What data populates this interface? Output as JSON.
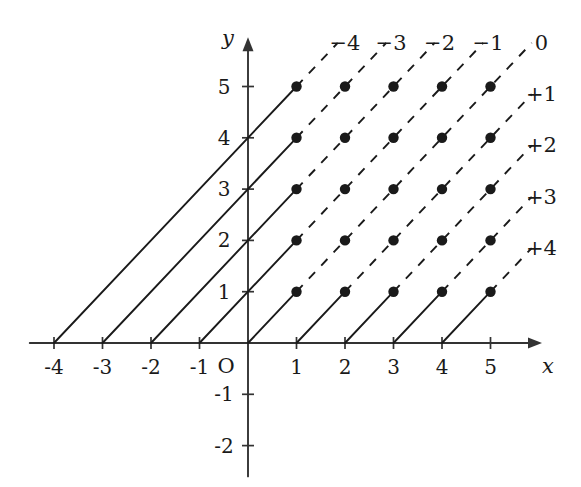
{
  "figure": {
    "axes": {
      "x_name": "x",
      "y_name": "y",
      "origin_label": "O",
      "x_ticks": [
        {
          "value": -4,
          "label": "-4"
        },
        {
          "value": -3,
          "label": "-3"
        },
        {
          "value": -2,
          "label": "-2"
        },
        {
          "value": -1,
          "label": "-1"
        },
        {
          "value": 1,
          "label": "1"
        },
        {
          "value": 2,
          "label": "2"
        },
        {
          "value": 3,
          "label": "3"
        },
        {
          "value": 4,
          "label": "4"
        },
        {
          "value": 5,
          "label": "5"
        }
      ],
      "y_ticks": [
        {
          "value": 5,
          "label": "5"
        },
        {
          "value": 4,
          "label": "4"
        },
        {
          "value": 3,
          "label": "3"
        },
        {
          "value": 2,
          "label": "2"
        },
        {
          "value": 1,
          "label": "1"
        },
        {
          "value": -1,
          "label": "-1"
        },
        {
          "value": -2,
          "label": "-2"
        }
      ],
      "x_range": [
        -4.5,
        6.0
      ],
      "y_range": [
        -2.6,
        5.9
      ]
    },
    "line_labels": [
      {
        "id": "c-minus-4",
        "text": "−4",
        "x": 2.0,
        "y": 5.85
      },
      {
        "id": "c-minus-3",
        "text": "−3",
        "x": 2.95,
        "y": 5.85
      },
      {
        "id": "c-minus-2",
        "text": "−2",
        "x": 3.95,
        "y": 5.85
      },
      {
        "id": "c-minus-1",
        "text": "−1",
        "x": 4.95,
        "y": 5.85
      },
      {
        "id": "c-zero",
        "text": "0",
        "x": 6.05,
        "y": 5.85
      },
      {
        "id": "c-plus-1",
        "text": "+1",
        "x": 6.05,
        "y": 4.85
      },
      {
        "id": "c-plus-2",
        "text": "+2",
        "x": 6.05,
        "y": 3.85
      },
      {
        "id": "c-plus-3",
        "text": "+3",
        "x": 6.05,
        "y": 2.85
      },
      {
        "id": "c-plus-4",
        "text": "+4",
        "x": 6.05,
        "y": 1.85
      }
    ]
  },
  "chart_data": {
    "type": "scatter",
    "xlabel": "x",
    "ylabel": "y",
    "xlim": [
      -4.5,
      6.0
    ],
    "ylim": [
      -2.6,
      5.9
    ],
    "grid": false,
    "legend_position": "inline-end-of-line",
    "x_tick_values": [
      -4,
      -3,
      -2,
      -1,
      1,
      2,
      3,
      4,
      5
    ],
    "y_tick_values": [
      5,
      4,
      3,
      2,
      1,
      -1,
      -2
    ],
    "lines": [
      {
        "label": "−4",
        "c": -4,
        "equation": "y = x + 4",
        "x_intercept": -4,
        "solid_from": [
          -4,
          0
        ],
        "solid_to": [
          1,
          5
        ],
        "dashed_to": [
          1.85,
          5.85
        ],
        "points": [
          [
            1,
            5
          ]
        ]
      },
      {
        "label": "−3",
        "c": -3,
        "equation": "y = x + 3",
        "x_intercept": -3,
        "solid_from": [
          -3,
          0
        ],
        "solid_to": [
          1,
          4
        ],
        "dashed_to": [
          2.85,
          5.85
        ],
        "points": [
          [
            1,
            4
          ],
          [
            2,
            5
          ]
        ]
      },
      {
        "label": "−2",
        "c": -2,
        "equation": "y = x + 2",
        "x_intercept": -2,
        "solid_from": [
          -2,
          0
        ],
        "solid_to": [
          1,
          3
        ],
        "dashed_to": [
          3.85,
          5.85
        ],
        "points": [
          [
            1,
            3
          ],
          [
            2,
            4
          ],
          [
            3,
            5
          ]
        ]
      },
      {
        "label": "−1",
        "c": -1,
        "equation": "y = x + 1",
        "x_intercept": -1,
        "solid_from": [
          -1,
          0
        ],
        "solid_to": [
          1,
          2
        ],
        "dashed_to": [
          4.85,
          5.85
        ],
        "points": [
          [
            1,
            2
          ],
          [
            2,
            3
          ],
          [
            3,
            4
          ],
          [
            4,
            5
          ]
        ]
      },
      {
        "label": "0",
        "c": 0,
        "equation": "y = x",
        "x_intercept": 0,
        "solid_from": [
          0,
          0
        ],
        "solid_to": [
          1,
          1
        ],
        "dashed_to": [
          5.85,
          5.85
        ],
        "points": [
          [
            1,
            1
          ],
          [
            2,
            2
          ],
          [
            3,
            3
          ],
          [
            4,
            4
          ],
          [
            5,
            5
          ]
        ]
      },
      {
        "label": "+1",
        "c": 1,
        "equation": "y = x - 1",
        "x_intercept": 1,
        "solid_from": [
          1,
          0
        ],
        "solid_to": [
          2,
          1
        ],
        "dashed_to": [
          5.85,
          4.85
        ],
        "points": [
          [
            2,
            1
          ],
          [
            3,
            2
          ],
          [
            4,
            3
          ],
          [
            5,
            4
          ]
        ]
      },
      {
        "label": "+2",
        "c": 2,
        "equation": "y = x - 2",
        "x_intercept": 2,
        "solid_from": [
          2,
          0
        ],
        "solid_to": [
          3,
          1
        ],
        "dashed_to": [
          5.85,
          3.85
        ],
        "points": [
          [
            3,
            1
          ],
          [
            4,
            2
          ],
          [
            5,
            3
          ]
        ]
      },
      {
        "label": "+3",
        "c": 3,
        "equation": "y = x - 3",
        "x_intercept": 3,
        "solid_from": [
          3,
          0
        ],
        "solid_to": [
          4,
          1
        ],
        "dashed_to": [
          5.85,
          2.85
        ],
        "points": [
          [
            4,
            1
          ],
          [
            5,
            2
          ]
        ]
      },
      {
        "label": "+4",
        "c": 4,
        "equation": "y = x - 4",
        "x_intercept": 4,
        "solid_from": [
          4,
          0
        ],
        "solid_to": [
          5,
          1
        ],
        "dashed_to": [
          5.85,
          1.85
        ],
        "points": [
          [
            5,
            1
          ]
        ]
      }
    ],
    "all_points": [
      [
        1,
        1
      ],
      [
        1,
        2
      ],
      [
        1,
        3
      ],
      [
        1,
        4
      ],
      [
        1,
        5
      ],
      [
        2,
        1
      ],
      [
        2,
        2
      ],
      [
        2,
        3
      ],
      [
        2,
        4
      ],
      [
        2,
        5
      ],
      [
        3,
        1
      ],
      [
        3,
        2
      ],
      [
        3,
        3
      ],
      [
        3,
        4
      ],
      [
        3,
        5
      ],
      [
        4,
        1
      ],
      [
        4,
        2
      ],
      [
        4,
        3
      ],
      [
        4,
        4
      ],
      [
        4,
        5
      ],
      [
        5,
        1
      ],
      [
        5,
        2
      ],
      [
        5,
        3
      ],
      [
        5,
        4
      ],
      [
        5,
        5
      ]
    ]
  },
  "style": {
    "ink": "#1a1a1a",
    "axis": "#333333",
    "background": "#ffffff"
  }
}
